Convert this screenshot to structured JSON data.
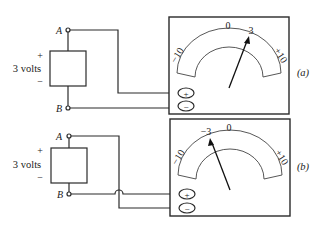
{
  "figure": {
    "circuits": [
      {
        "id": "a",
        "label": "(a)",
        "source": {
          "plus": "+",
          "minus": "−",
          "voltage_label": "3 volts",
          "node_top": "A",
          "node_bottom": "B"
        },
        "meter": {
          "scale_min": "−10",
          "scale_zero": "0",
          "scale_max": "+10",
          "reading_label": "3",
          "reading_value": 3,
          "terminal_plus": "+",
          "terminal_minus": "−"
        },
        "wiring": "A to plus terminal, B to minus terminal"
      },
      {
        "id": "b",
        "label": "(b)",
        "source": {
          "plus": "+",
          "minus": "−",
          "voltage_label": "3 volts",
          "node_top": "A",
          "node_bottom": "B"
        },
        "meter": {
          "scale_min": "−10",
          "scale_zero": "0",
          "scale_max": "+10",
          "reading_label": "−3",
          "reading_value": -3,
          "terminal_plus": "+",
          "terminal_minus": "−"
        },
        "wiring": "A to minus terminal, B to plus terminal (crossed wires)"
      }
    ]
  }
}
